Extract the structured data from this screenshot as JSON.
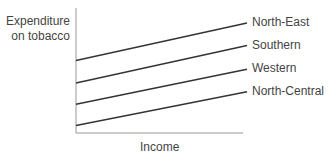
{
  "chart_data": {
    "type": "line",
    "title": "",
    "xlabel": "Income",
    "ylabel": "Expenditure on tobacco",
    "ylabel_lines": [
      "Expenditure",
      "on tobacco"
    ],
    "grid": false,
    "legend_position": "inline-right",
    "x": [
      0,
      1
    ],
    "xlim": [
      0,
      1
    ],
    "ylim": [
      0,
      1
    ],
    "series": [
      {
        "name": "North-East",
        "values": [
          0.58,
          0.88
        ]
      },
      {
        "name": "Southern",
        "values": [
          0.4,
          0.7
        ]
      },
      {
        "name": "Western",
        "values": [
          0.23,
          0.51
        ]
      },
      {
        "name": "North-Central",
        "values": [
          0.06,
          0.33
        ]
      }
    ]
  },
  "colors": {
    "line": "#333333",
    "axis": "#888888",
    "text": "#444444"
  }
}
